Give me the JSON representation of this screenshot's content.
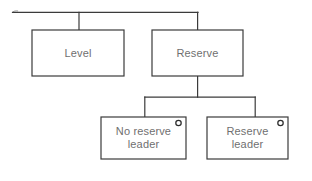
{
  "diagram": {
    "type": "tree-hierarchy",
    "background_color": "#ffffff",
    "stroke_color": "#3b3b3b",
    "text_color": "#6f6f6f",
    "nodes": [
      {
        "id": "level",
        "label": "Level",
        "x": 32,
        "y": 30,
        "width": 92,
        "height": 46,
        "has_port_marker": false
      },
      {
        "id": "reserve",
        "label": "Reserve",
        "x": 152,
        "y": 30,
        "width": 91,
        "height": 46,
        "has_port_marker": false
      },
      {
        "id": "no-reserve-leader",
        "label": "No reserve\nleader",
        "x": 101,
        "y": 117,
        "width": 85,
        "height": 42,
        "has_port_marker": true
      },
      {
        "id": "reserve-leader",
        "label": "Reserve\nleader",
        "x": 207,
        "y": 117,
        "width": 81,
        "height": 42,
        "has_port_marker": true
      }
    ],
    "connectors": [
      {
        "id": "root-bus",
        "from": "root",
        "to": "level-and-reserve"
      },
      {
        "id": "root-to-level",
        "from": "root",
        "to": "level"
      },
      {
        "id": "root-to-reserve",
        "from": "root",
        "to": "reserve"
      },
      {
        "id": "reserve-to-no-reserve-leader",
        "from": "reserve",
        "to": "no-reserve-leader"
      },
      {
        "id": "reserve-to-reserve-leader",
        "from": "reserve",
        "to": "reserve-leader"
      }
    ],
    "port_marker": {
      "shape": "circle",
      "radius": 2.6,
      "offset_x": 8,
      "offset_y": 6
    }
  }
}
